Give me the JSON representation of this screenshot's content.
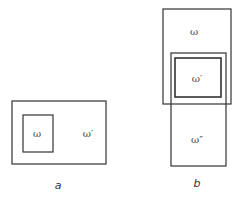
{
  "figure_a": {
    "caption": "a",
    "outer_label": "ω′",
    "inner_label": "ω"
  },
  "figure_b": {
    "caption": "b",
    "top_label": "ω",
    "middle_label": "ω′",
    "bottom_label": "ω″"
  },
  "colors": {
    "stroke": "#333333",
    "text": "#444444",
    "background": "#ffffff"
  }
}
